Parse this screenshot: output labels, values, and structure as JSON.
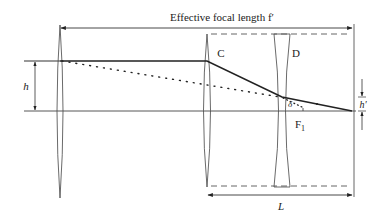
{
  "diagram": {
    "labels": {
      "focal_length": "Effective focal length f′",
      "lens_c": "C",
      "lens_d": "D",
      "h": "h",
      "h_prime": "h′",
      "focal_point": "F",
      "focal_point_sub": "1",
      "delta": "δ",
      "length": "L"
    },
    "elements": [
      {
        "id": "lens-a",
        "type": "converging lens (thin, equivalent)"
      },
      {
        "id": "lens-c",
        "type": "converging lens",
        "label": "C"
      },
      {
        "id": "lens-d",
        "type": "diverging lens",
        "label": "D"
      }
    ],
    "dimensions": [
      {
        "name": "effective focal length",
        "symbol": "f′"
      },
      {
        "name": "system length",
        "symbol": "L"
      },
      {
        "name": "incident ray height",
        "symbol": "h"
      },
      {
        "name": "ray height at D",
        "symbol": "h′"
      }
    ],
    "colors": {
      "line": "#333333",
      "ray": "#222222",
      "background": "#ffffff"
    }
  }
}
